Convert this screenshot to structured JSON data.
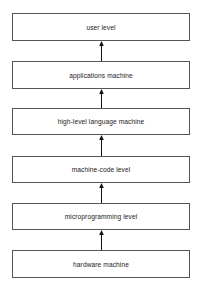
{
  "diagram": {
    "type": "layered-hierarchy",
    "direction": "bottom-to-top",
    "levels": [
      {
        "label": "user level"
      },
      {
        "label": "applications machine"
      },
      {
        "label": "high-level language machine"
      },
      {
        "label": "machine-code level"
      },
      {
        "label": "microprogramming level"
      },
      {
        "label": "hardware machine"
      }
    ],
    "arrows": [
      {
        "from": "applications machine",
        "to": "user level"
      },
      {
        "from": "high-level language machine",
        "to": "applications machine"
      },
      {
        "from": "machine-code level",
        "to": "high-level language machine"
      },
      {
        "from": "microprogramming level",
        "to": "machine-code level"
      },
      {
        "from": "hardware machine",
        "to": "microprogramming level"
      }
    ],
    "colors": {
      "border": "#555555",
      "text": "#222222",
      "arrow": "#111111",
      "background": "#ffffff"
    }
  }
}
